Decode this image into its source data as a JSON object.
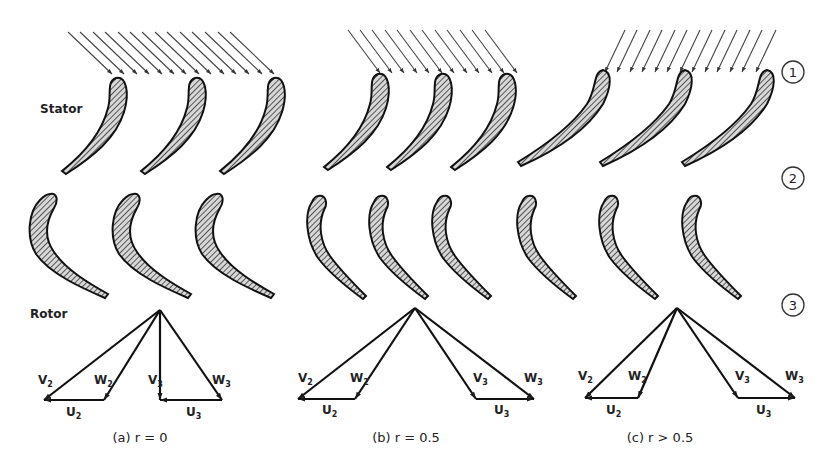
{
  "labels": {
    "stator": "Stator",
    "rotor": "Rotor"
  },
  "stations": [
    "1",
    "2",
    "3"
  ],
  "cases": [
    {
      "caption": "(a) r = 0",
      "v2": "V",
      "v2_sub": "2",
      "w2": "W",
      "w2_sub": "2",
      "v3": "V",
      "v3_sub": "3",
      "w3": "W",
      "w3_sub": "3",
      "u2": "U",
      "u2_sub": "2",
      "u3": "U",
      "u3_sub": "3"
    },
    {
      "caption": "(b) r = 0.5",
      "v2": "V",
      "v2_sub": "2",
      "w2": "W",
      "w2_sub": "2",
      "v3": "V",
      "v3_sub": "3",
      "w3": "W",
      "w3_sub": "3",
      "u2": "U",
      "u2_sub": "2",
      "u3": "U",
      "u3_sub": "3"
    },
    {
      "caption": "(c) r > 0.5",
      "v2": "V",
      "v2_sub": "2",
      "w2": "W",
      "w2_sub": "2",
      "v3": "V",
      "v3_sub": "3",
      "w3": "W",
      "w3_sub": "3",
      "u2": "U",
      "u2_sub": "2",
      "u3": "U",
      "u3_sub": "3"
    }
  ],
  "colors": {
    "ink": "#1a1a1a",
    "blade_fill": "#9a9a9a",
    "background": "#ffffff"
  }
}
